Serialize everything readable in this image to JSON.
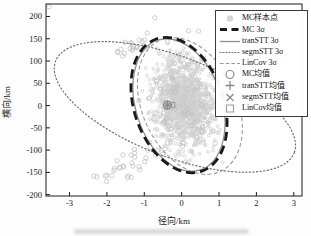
{
  "colors": {
    "mc": "#1a1a1a",
    "tranSTT": "#8f8f8f",
    "segmSTT": "#6e6e6e",
    "linCov": "#9a9a9a",
    "samples": "#d6d6d6",
    "sample_stroke": "#cfcfcf",
    "outlier_stroke": "#c2c2c2",
    "means": "#8a8a8a",
    "axis": "#1a1a1a"
  },
  "axes": {
    "xlabel": "径向/km",
    "ylabel": "横向/km"
  },
  "legend": {
    "items": [
      {
        "label": "MC样本点",
        "swatch": "sample-point"
      },
      {
        "label": "MC 3σ",
        "swatch": "thick-dashed-line"
      },
      {
        "label": "tranSTT 3σ",
        "swatch": "solid-line"
      },
      {
        "label": "segmSTT 3σ",
        "swatch": "dotted-line"
      },
      {
        "label": "LinCov 3σ",
        "swatch": "fine-dashed-line"
      },
      {
        "label": "MC均值",
        "swatch": "circle-marker"
      },
      {
        "label": "tranSTT均值",
        "swatch": "plus-marker"
      },
      {
        "label": "segmSTT均值",
        "swatch": "x-marker"
      },
      {
        "label": "LinCov均值",
        "swatch": "square-marker"
      }
    ]
  },
  "chart_data": {
    "type": "scatter",
    "title": "",
    "xlabel": "径向/km",
    "ylabel": "横向/km",
    "xlim": [
      -3.63,
      3.22
    ],
    "ylim": [
      -203,
      228
    ],
    "xticks": [
      -3,
      -2,
      -1,
      0,
      1,
      2,
      3
    ],
    "yticks": [
      200,
      150,
      100,
      50,
      0,
      -50,
      -100,
      -150,
      -200
    ],
    "grid": false,
    "legend_position": "upper-right",
    "samples": {
      "label": "MC样本点",
      "main_cloud": {
        "n": 1300,
        "mean": [
          0.05,
          8
        ],
        "sigma": [
          0.4,
          50
        ],
        "rho": -0.15,
        "clip_sigma": 2.8
      },
      "edge_points": {
        "n": 70,
        "mean": [
          0.0,
          5
        ],
        "sigma": [
          0.46,
          56
        ],
        "rho": -0.15,
        "clip_sigma": 2.5
      },
      "upper_tail": {
        "n": 20,
        "mean": [
          -1.5,
          125
        ],
        "sigma": [
          0.33,
          20
        ],
        "rho": 0.8,
        "clip_sigma": 2.2
      },
      "lower_tail": {
        "n": 30,
        "mean": [
          -1.35,
          -135
        ],
        "sigma": [
          0.42,
          26
        ],
        "rho": 0.75,
        "clip_sigma": 2.2
      },
      "isolated_points": [
        [
          -3.55,
          222
        ],
        [
          -0.72,
          197
        ],
        [
          0.18,
          168
        ],
        [
          0.45,
          167
        ],
        [
          -2.35,
          -158
        ]
      ]
    },
    "ellipses": [
      {
        "name": "MC 3σ",
        "series": "mc",
        "center": [
          -0.07,
          1
        ],
        "semi_axis_x_km": 1.2,
        "semi_axis_y_km": 157,
        "tilt_deg": -19,
        "line": "thick-dashed"
      },
      {
        "name": "tranSTT 3σ",
        "series": "tranSTT",
        "center": [
          -0.07,
          1
        ],
        "semi_axis_x_km": 1.15,
        "semi_axis_y_km": 153,
        "tilt_deg": -18,
        "line": "solid"
      },
      {
        "name": "segmSTT 3σ",
        "series": "segmSTT",
        "center": [
          -0.18,
          -3
        ],
        "semi_axis_x_km": 3.42,
        "semi_axis_y_km": 112,
        "tilt_deg": 21,
        "line": "dotted"
      },
      {
        "name": "LinCov 3σ",
        "series": "linCov",
        "center": [
          0.22,
          -1
        ],
        "semi_axis_x_km": 1.26,
        "semi_axis_y_km": 162,
        "tilt_deg": -25,
        "line": "fine-dashed"
      }
    ],
    "means": [
      {
        "name": "MC均值",
        "marker": "circle",
        "pos": [
          -0.38,
          1
        ]
      },
      {
        "name": "tranSTT均值",
        "marker": "plus",
        "pos": [
          -0.38,
          1
        ]
      },
      {
        "name": "segmSTT均值",
        "marker": "x",
        "pos": [
          -0.38,
          1
        ]
      },
      {
        "name": "LinCov均值",
        "marker": "square",
        "pos": [
          -0.25,
          1
        ]
      }
    ]
  }
}
